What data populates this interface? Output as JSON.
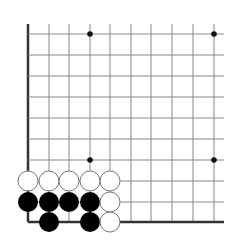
{
  "board": {
    "type": "go-diagram",
    "corner": "bottom-left",
    "visible_columns": 10,
    "visible_rows": 10,
    "colors": {
      "background": "#ffffff",
      "grid_line": "#888888",
      "edge_line": "#333333",
      "black_stone": "#000000",
      "white_stone": "#ffffff",
      "white_stone_border": "#777777",
      "star_point": "#111111"
    },
    "x_lines": [
      28,
      49,
      69,
      90,
      110,
      131,
      151,
      172,
      193,
      214
    ],
    "y_lines": [
      34,
      55,
      76,
      97,
      118,
      139,
      160,
      181,
      202,
      222
    ],
    "star_points": [
      {
        "col": 3,
        "row": 0
      },
      {
        "col": 9,
        "row": 0
      },
      {
        "col": 3,
        "row": 6
      },
      {
        "col": 9,
        "row": 6
      }
    ],
    "stones": [
      {
        "color": "white",
        "col": 0,
        "row": 7
      },
      {
        "color": "white",
        "col": 1,
        "row": 7
      },
      {
        "color": "white",
        "col": 2,
        "row": 7
      },
      {
        "color": "white",
        "col": 3,
        "row": 7
      },
      {
        "color": "white",
        "col": 4,
        "row": 7
      },
      {
        "color": "black",
        "col": 0,
        "row": 8
      },
      {
        "color": "black",
        "col": 1,
        "row": 8
      },
      {
        "color": "black",
        "col": 2,
        "row": 8
      },
      {
        "color": "black",
        "col": 3,
        "row": 8
      },
      {
        "color": "white",
        "col": 4,
        "row": 8
      },
      {
        "color": "black",
        "col": 1,
        "row": 9
      },
      {
        "color": "black",
        "col": 3,
        "row": 9
      },
      {
        "color": "white",
        "col": 4,
        "row": 9
      }
    ]
  }
}
